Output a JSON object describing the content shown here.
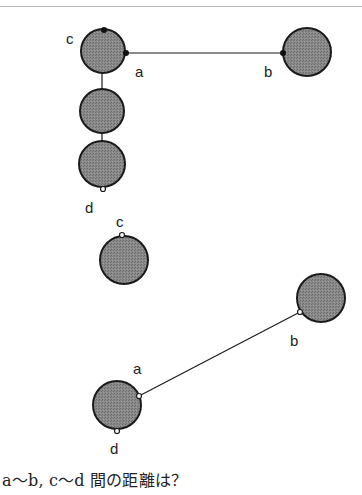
{
  "colors": {
    "ball_fill": "#7f7f7f",
    "ball_stroke": "#1a1a1a",
    "line": "#1a1a1a",
    "text": "#222222",
    "rule": "#b8b8b8"
  },
  "figure_top": {
    "description": "Three balls stacked vertically connected by short links, top ball joined to a separate ball by a horizontal line",
    "labels": {
      "a": "a",
      "b": "b",
      "c": "c",
      "d": "d"
    },
    "balls": [
      {
        "id": "top-1",
        "cx": 103,
        "cy": 51,
        "r": 22
      },
      {
        "id": "top-2",
        "cx": 102,
        "cy": 111,
        "r": 22
      },
      {
        "id": "top-3",
        "cx": 102,
        "cy": 164,
        "r": 23
      },
      {
        "id": "top-b",
        "cx": 307,
        "cy": 52,
        "r": 24
      }
    ],
    "points": {
      "a": {
        "x": 126,
        "y": 53,
        "style": "filled"
      },
      "b": {
        "x": 283,
        "y": 53,
        "style": "filled"
      },
      "c": {
        "x": 104,
        "y": 30,
        "style": "filled"
      },
      "d": {
        "x": 103,
        "y": 189,
        "style": "open"
      }
    }
  },
  "figure_bottom": {
    "description": "Single ball with point c, and two balls joined by a diagonal line a–b with point d at bottom",
    "labels": {
      "a": "a",
      "b": "b",
      "c": "c",
      "d": "d"
    },
    "balls": [
      {
        "id": "mid-c",
        "cx": 124,
        "cy": 260,
        "r": 24
      },
      {
        "id": "bot-b",
        "cx": 321,
        "cy": 298,
        "r": 24
      },
      {
        "id": "bot-a",
        "cx": 117,
        "cy": 405,
        "r": 24
      }
    ],
    "points": {
      "c": {
        "x": 122,
        "y": 235,
        "style": "open"
      },
      "b": {
        "x": 300,
        "y": 312,
        "style": "open"
      },
      "a": {
        "x": 139,
        "y": 396,
        "style": "open"
      },
      "d": {
        "x": 117,
        "y": 431,
        "style": "open"
      }
    }
  },
  "question": {
    "text": "a～b, c～d 間の距離は？"
  }
}
